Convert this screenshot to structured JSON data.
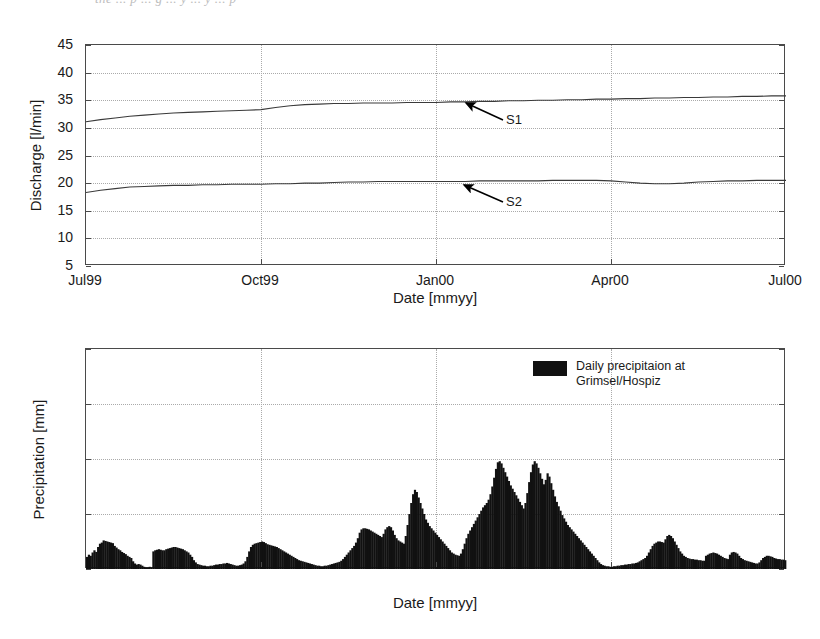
{
  "artifact_text": "the  ...  p  ...  g  ...  y  ...  y  ...  p",
  "charts": {
    "discharge": {
      "ylabel": "Discharge  [l/min]",
      "xlabel": "Date  [mmyy]",
      "yticks": [
        "45",
        "40",
        "35",
        "30",
        "25",
        "20",
        "15",
        "10",
        "5"
      ],
      "xticks": [
        "Jul99",
        "Oct99",
        "Jan00",
        "Apr00",
        "Jul00"
      ],
      "annotations": [
        {
          "label": "S1"
        },
        {
          "label": "S2"
        }
      ]
    },
    "precipitation": {
      "ylabel": "Precipitation  [mm]",
      "xlabel": "Date  [mmyy]",
      "yticks": [
        "40",
        "30",
        "20",
        "10",
        "0"
      ],
      "xticks": [
        "Jul99",
        "Oct99",
        "Jan00",
        "Apr00",
        "Jul00"
      ],
      "legend": {
        "label": "Daily precipitaion at\nGrimsel/Hospiz",
        "color": "#111111"
      }
    }
  },
  "chart_data": [
    {
      "type": "line",
      "title": "",
      "xlabel": "Date  [mmyy]",
      "ylabel": "Discharge  [l/min]",
      "xlim": [
        0,
        12
      ],
      "ylim": [
        5,
        45
      ],
      "ytick_values": [
        5,
        10,
        15,
        20,
        25,
        30,
        35,
        40,
        45
      ],
      "xtick_values": [
        0,
        3,
        6,
        9,
        12
      ],
      "xtick_labels": [
        "Jul99",
        "Oct99",
        "Jan00",
        "Apr00",
        "Jul00"
      ],
      "grid": true,
      "legend": "none",
      "annotations": [
        {
          "text": "S1",
          "x": 7.0,
          "y": 29.6,
          "points_to": [
            6.2,
            34.6
          ]
        },
        {
          "text": "S2",
          "x": 7.0,
          "y": 16.6,
          "points_to": [
            6.2,
            19.9
          ]
        }
      ],
      "series": [
        {
          "name": "S1",
          "x": [
            0,
            0.25,
            0.5,
            0.75,
            1,
            1.25,
            1.5,
            1.75,
            2,
            2.25,
            2.5,
            2.75,
            3,
            3.25,
            3.5,
            3.75,
            4,
            4.25,
            4.5,
            4.75,
            5,
            5.25,
            5.5,
            5.75,
            6,
            6.25,
            6.5,
            6.75,
            7,
            7.25,
            7.5,
            7.75,
            8,
            8.25,
            8.5,
            8.75,
            9,
            9.25,
            9.5,
            9.75,
            10,
            10.25,
            10.5,
            10.75,
            11,
            11.25,
            11.5,
            11.75,
            12
          ],
          "y": [
            31.1,
            31.5,
            31.8,
            32.1,
            32.3,
            32.5,
            32.7,
            32.8,
            32.9,
            33.0,
            33.1,
            33.2,
            33.3,
            33.7,
            34.0,
            34.2,
            34.3,
            34.4,
            34.4,
            34.5,
            34.5,
            34.5,
            34.6,
            34.6,
            34.6,
            34.7,
            34.7,
            34.8,
            34.8,
            34.9,
            34.9,
            35.0,
            35.0,
            35.1,
            35.1,
            35.2,
            35.2,
            35.3,
            35.3,
            35.4,
            35.4,
            35.5,
            35.5,
            35.6,
            35.6,
            35.7,
            35.7,
            35.8,
            35.8
          ]
        },
        {
          "name": "S2",
          "x": [
            0,
            0.25,
            0.5,
            0.75,
            1,
            1.25,
            1.5,
            1.75,
            2,
            2.25,
            2.5,
            2.75,
            3,
            3.25,
            3.5,
            3.75,
            4,
            4.25,
            4.5,
            4.75,
            5,
            5.25,
            5.5,
            5.75,
            6,
            6.25,
            6.5,
            6.75,
            7,
            7.25,
            7.5,
            7.75,
            8,
            8.25,
            8.5,
            8.75,
            9,
            9.25,
            9.5,
            9.75,
            10,
            10.25,
            10.5,
            10.75,
            11,
            11.25,
            11.5,
            11.75,
            12
          ],
          "y": [
            18.3,
            18.7,
            19.0,
            19.3,
            19.4,
            19.5,
            19.6,
            19.6,
            19.7,
            19.7,
            19.8,
            19.8,
            19.8,
            19.9,
            19.9,
            20.0,
            20.0,
            20.1,
            20.2,
            20.2,
            20.3,
            20.3,
            20.3,
            20.3,
            20.3,
            20.3,
            20.3,
            20.4,
            20.4,
            20.4,
            20.4,
            20.4,
            20.5,
            20.5,
            20.5,
            20.5,
            20.4,
            20.2,
            20.0,
            19.9,
            19.9,
            20.0,
            20.2,
            20.3,
            20.4,
            20.4,
            20.5,
            20.5,
            20.5
          ]
        }
      ]
    },
    {
      "type": "bar",
      "title": "",
      "xlabel": "Date  [mmyy]",
      "ylabel": "Precipitation  [mm]",
      "xlim": [
        0,
        12
      ],
      "ylim": [
        0,
        40
      ],
      "ytick_values": [
        0,
        10,
        20,
        30,
        40
      ],
      "xtick_values": [
        0,
        3,
        6,
        9,
        12
      ],
      "xtick_labels": [
        "Jul99",
        "Oct99",
        "Jan00",
        "Apr00",
        "Jul00"
      ],
      "grid": true,
      "legend": "Daily precipitaion at Grimsel/Hospiz",
      "bar_color": "#111111",
      "note": "values are daily precipitation in mm, 365 samples Jul99-Jul00",
      "values": [
        2.2,
        2.6,
        2.4,
        3.0,
        3.4,
        3.1,
        4.0,
        4.6,
        4.8,
        5.2,
        5.1,
        5.0,
        4.9,
        4.8,
        4.7,
        4.2,
        3.9,
        3.6,
        3.4,
        3.1,
        2.9,
        2.7,
        2.4,
        2.2,
        2.0,
        1.4,
        1.0,
        0.8,
        0.9,
        0.8,
        0.6,
        0.4,
        0.3,
        0.3,
        0.4,
        0.3,
        3.2,
        3.4,
        3.5,
        3.6,
        3.5,
        3.4,
        3.4,
        3.6,
        3.7,
        3.8,
        3.9,
        4.0,
        4.0,
        3.9,
        3.8,
        3.7,
        3.6,
        3.4,
        3.2,
        3.0,
        2.6,
        2.2,
        1.6,
        1.2,
        0.9,
        0.8,
        0.7,
        0.6,
        0.6,
        0.5,
        0.5,
        0.6,
        0.6,
        0.7,
        0.8,
        0.8,
        0.9,
        0.9,
        1.0,
        1.0,
        1.1,
        1.0,
        0.9,
        0.8,
        0.7,
        0.6,
        0.6,
        0.7,
        0.8,
        1.0,
        1.4,
        2.2,
        3.2,
        4.0,
        4.4,
        4.6,
        4.7,
        4.8,
        4.9,
        5.0,
        4.9,
        4.7,
        4.5,
        4.4,
        4.3,
        4.2,
        4.1,
        4.0,
        3.8,
        3.6,
        3.4,
        3.2,
        3.0,
        2.8,
        2.6,
        2.4,
        2.2,
        2.0,
        1.8,
        1.6,
        1.5,
        1.4,
        1.3,
        1.2,
        1.1,
        1.0,
        0.9,
        0.8,
        0.7,
        0.6,
        0.6,
        0.5,
        0.5,
        0.6,
        0.6,
        0.7,
        0.8,
        0.9,
        1.0,
        1.1,
        1.2,
        1.3,
        1.5,
        1.8,
        2.2,
        2.6,
        3.0,
        3.4,
        3.8,
        4.2,
        4.8,
        5.6,
        6.6,
        7.2,
        7.4,
        7.4,
        7.3,
        7.2,
        7.0,
        6.8,
        6.6,
        6.4,
        6.2,
        6.0,
        5.8,
        6.4,
        7.2,
        7.6,
        7.8,
        7.6,
        7.0,
        6.2,
        5.6,
        5.2,
        5.0,
        4.8,
        4.6,
        6.0,
        8.0,
        10.0,
        12.0,
        13.6,
        14.4,
        14.0,
        13.0,
        12.0,
        11.0,
        10.0,
        9.0,
        8.4,
        7.8,
        7.4,
        7.0,
        6.6,
        6.2,
        5.8,
        5.4,
        5.0,
        4.6,
        4.2,
        3.8,
        3.4,
        3.0,
        2.8,
        2.6,
        2.5,
        2.4,
        2.8,
        3.6,
        4.6,
        5.6,
        6.4,
        7.0,
        7.6,
        8.2,
        8.8,
        9.4,
        10.0,
        10.6,
        11.2,
        11.6,
        12.0,
        12.6,
        13.6,
        15.0,
        16.6,
        18.2,
        19.4,
        19.6,
        19.2,
        18.4,
        17.6,
        16.8,
        16.0,
        15.2,
        14.6,
        14.0,
        13.4,
        12.8,
        12.2,
        11.6,
        11.0,
        12.0,
        13.8,
        15.8,
        17.6,
        19.0,
        19.6,
        19.2,
        18.4,
        17.4,
        16.4,
        15.4,
        16.2,
        17.4,
        16.8,
        15.6,
        14.4,
        13.2,
        12.2,
        11.4,
        10.6,
        9.8,
        9.2,
        8.6,
        8.0,
        7.6,
        7.2,
        6.8,
        6.4,
        6.0,
        5.6,
        5.2,
        4.8,
        4.4,
        4.0,
        3.6,
        3.2,
        2.8,
        2.4,
        2.0,
        1.6,
        1.2,
        0.9,
        0.7,
        0.6,
        0.5,
        0.5,
        0.4,
        0.4,
        0.5,
        0.5,
        0.6,
        0.6,
        0.7,
        0.7,
        0.8,
        0.8,
        0.9,
        0.9,
        1.0,
        1.0,
        1.1,
        1.2,
        1.4,
        1.6,
        1.8,
        2.0,
        2.4,
        3.0,
        3.6,
        4.2,
        4.6,
        4.8,
        5.0,
        5.0,
        4.9,
        4.8,
        5.4,
        6.0,
        6.2,
        6.0,
        5.6,
        5.0,
        4.4,
        3.8,
        3.2,
        2.8,
        2.4,
        2.2,
        2.0,
        1.9,
        1.8,
        1.8,
        1.7,
        1.7,
        1.6,
        1.6,
        1.5,
        1.5,
        2.4,
        2.6,
        2.8,
        2.9,
        3.0,
        2.9,
        2.8,
        2.6,
        2.4,
        2.2,
        2.0,
        1.9,
        1.8,
        2.6,
        3.0,
        3.1,
        3.0,
        2.8,
        2.4,
        2.0,
        1.8,
        1.6,
        1.5,
        1.4,
        1.3,
        1.2,
        1.1,
        1.0,
        1.0,
        1.2,
        1.6,
        2.0,
        2.2,
        2.4,
        2.4,
        2.3,
        2.2,
        2.0,
        1.9,
        1.8,
        1.8,
        1.7,
        1.7,
        1.6
      ]
    }
  ]
}
